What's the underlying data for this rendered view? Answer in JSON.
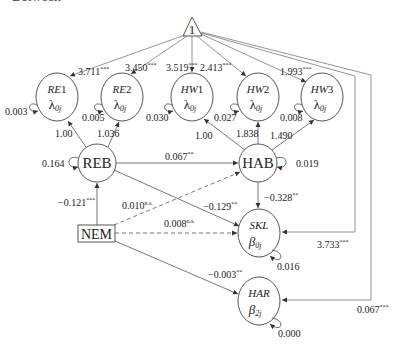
{
  "header": {
    "clipped_title": "Between"
  },
  "diagram": {
    "intercept": {
      "label": "1"
    },
    "indicators": [
      {
        "id": "RE1",
        "name_prefix": "RE",
        "name_suffix": "1",
        "param": "λ",
        "sub": "0j",
        "variance": "0.003",
        "intercept": "3.711",
        "intercept_sig": "***",
        "loading": "1.00"
      },
      {
        "id": "RE2",
        "name_prefix": "RE",
        "name_suffix": "2",
        "param": "λ",
        "sub": "0j",
        "variance": "0.005",
        "intercept": "3.450",
        "intercept_sig": "***",
        "loading": "1.036"
      },
      {
        "id": "HW1",
        "name_prefix": "HW",
        "name_suffix": "1",
        "param": "λ",
        "sub": "0j",
        "variance": "0.030",
        "intercept": "3.519",
        "intercept_sig": "***",
        "loading": "1.00"
      },
      {
        "id": "HW2",
        "name_prefix": "HW",
        "name_suffix": "2",
        "param": "λ",
        "sub": "0j",
        "variance": "0.027",
        "intercept": "2.413",
        "intercept_sig": "***",
        "loading": "1.838"
      },
      {
        "id": "HW3",
        "name_prefix": "HW",
        "name_suffix": "3",
        "param": "λ",
        "sub": "0j",
        "variance": "0.008",
        "intercept": "1.993",
        "intercept_sig": "***",
        "loading": "1.490"
      }
    ],
    "latents": {
      "REB": {
        "label": "REB",
        "variance": "0.164"
      },
      "HAB": {
        "label": "HAB",
        "variance": "0.019"
      }
    },
    "observed": {
      "NEM": {
        "label": "NEM"
      }
    },
    "outcomes": {
      "SKL": {
        "label": "SKL",
        "param": "β",
        "sub": "0j",
        "variance": "0.016",
        "intercept": "3.733",
        "intercept_sig": "***"
      },
      "HAR": {
        "label": "HAR",
        "param": "β",
        "sub": "2j",
        "variance": "0.000",
        "intercept": "0.067",
        "intercept_sig": "***"
      }
    },
    "paths": {
      "REB_HAB": {
        "value": "0.067",
        "sig": "**"
      },
      "NEM_REB": {
        "value": "−0.121",
        "sig": "***"
      },
      "NEM_HAB": {
        "value": "0.010",
        "sig": "n.s."
      },
      "REB_SKL": {
        "value": "−0.129",
        "sig": "**"
      },
      "NEM_SKL": {
        "value": "0.008",
        "sig": "n.s."
      },
      "HAB_SKL": {
        "value": "−0.328",
        "sig": "**"
      },
      "NEM_HAR": {
        "value": "−0.003",
        "sig": "**"
      }
    }
  },
  "colors": {
    "line": "#555555",
    "text": "#222222",
    "background": "#ffffff"
  }
}
